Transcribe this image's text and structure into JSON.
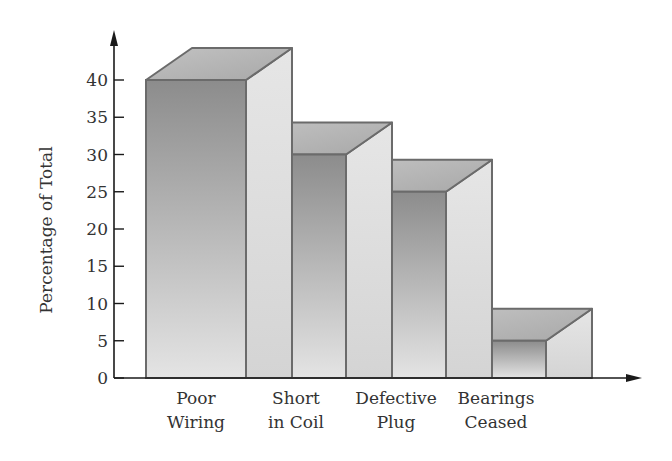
{
  "chart_data": {
    "type": "bar",
    "style": "3d-stepped",
    "title": "",
    "xlabel": "",
    "ylabel": "Percentage of Total",
    "categories": [
      "Poor Wiring",
      "Short in Coil",
      "Defective Plug",
      "Bearings Ceased"
    ],
    "category_lines": [
      [
        "Poor",
        "Wiring"
      ],
      [
        "Short",
        "in Coil"
      ],
      [
        "Defective",
        "Plug"
      ],
      [
        "Bearings",
        "Ceased"
      ]
    ],
    "values": [
      40,
      30,
      25,
      5
    ],
    "ylim": [
      0,
      40
    ],
    "yticks": [
      0,
      5,
      10,
      15,
      20,
      25,
      30,
      35,
      40
    ],
    "grid": false,
    "legend": null,
    "colors": {
      "front_dark": "#8e8e8e",
      "front_light": "#e2e2e2",
      "top": "#b4b4b4",
      "side": "#dcdcdc",
      "edge": "#6b6b6b",
      "axis": "#1a1a1a",
      "text": "#333333"
    }
  }
}
